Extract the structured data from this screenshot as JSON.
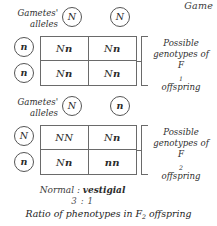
{
  "corner": {
    "label": "Game"
  },
  "sections": [
    {
      "id": "f1",
      "gametes_label_line1": "Gametes'",
      "gametes_label_line2": "alleles",
      "top_alleles": [
        "N",
        "N"
      ],
      "side_alleles": [
        "n",
        "n"
      ],
      "cells": [
        "Nn",
        "Nn",
        "Nn",
        "Nn"
      ],
      "caption_line1": "Possible",
      "caption_line2": "genotypes of",
      "caption_line3_prefix": "F",
      "caption_line3_sub": "1",
      "caption_line3_suffix": " offspring"
    },
    {
      "id": "f2",
      "gametes_label_line1": "Gametes'",
      "gametes_label_line2": "alleles",
      "top_alleles": [
        "N",
        "n"
      ],
      "side_alleles": [
        "N",
        "n"
      ],
      "cells": [
        "NN",
        "Nn",
        "Nn",
        "nn"
      ],
      "caption_line1": "Possible",
      "caption_line2": "genotypes of",
      "caption_line3_prefix": "F",
      "caption_line3_sub": "2",
      "caption_line3_suffix": " offspring"
    }
  ],
  "ratio": {
    "phenotype_dominant": "Normal",
    "separator": " : ",
    "phenotype_recessive": "vestigial",
    "numbers": "3 : 1",
    "caption_prefix": "Ratio of phenotypes in F",
    "caption_sub": "2",
    "caption_suffix": " offspring"
  },
  "colors": {
    "ink": "#2b2b2b",
    "rule": "#6a6a6a",
    "background": "#ffffff"
  }
}
